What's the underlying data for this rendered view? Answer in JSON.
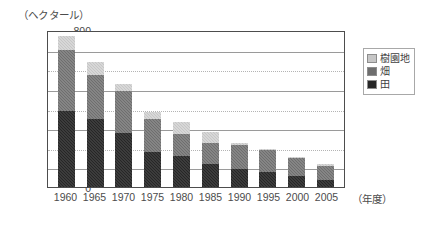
{
  "chart_data": {
    "type": "bar",
    "stacked": true,
    "title": "",
    "subtitle": "",
    "unit_label": "（ヘクタール）",
    "xlabel": "（年度）",
    "ylabel": "",
    "ylim": [
      0,
      800
    ],
    "ytick_step": 100,
    "yticks": [
      "800",
      "700",
      "600",
      "500",
      "400",
      "300",
      "200",
      "100",
      "0"
    ],
    "grid": true,
    "legend_position": "right-top",
    "categories": [
      "1960",
      "1965",
      "1970",
      "1975",
      "1980",
      "1985",
      "1990",
      "1995",
      "2000",
      "2005"
    ],
    "series": [
      {
        "name": "田",
        "color": "#262626",
        "values": [
          385,
          345,
          275,
          178,
          157,
          115,
          93,
          75,
          57,
          38
        ]
      },
      {
        "name": "畑",
        "color": "#6e6e6e",
        "values": [
          315,
          228,
          215,
          170,
          115,
          110,
          120,
          113,
          91,
          67
        ]
      },
      {
        "name": "樹園地",
        "color": "#c6c6c6",
        "values": [
          68,
          62,
          35,
          35,
          58,
          55,
          12,
          4,
          4,
          10
        ]
      }
    ],
    "totals": [
      768,
      635,
      525,
      383,
      330,
      280,
      225,
      192,
      152,
      115
    ]
  },
  "legend": {
    "items": [
      {
        "label": "樹園地",
        "color": "#c6c6c6"
      },
      {
        "label": "畑",
        "color": "#6e6e6e"
      },
      {
        "label": "田",
        "color": "#262626"
      }
    ]
  }
}
